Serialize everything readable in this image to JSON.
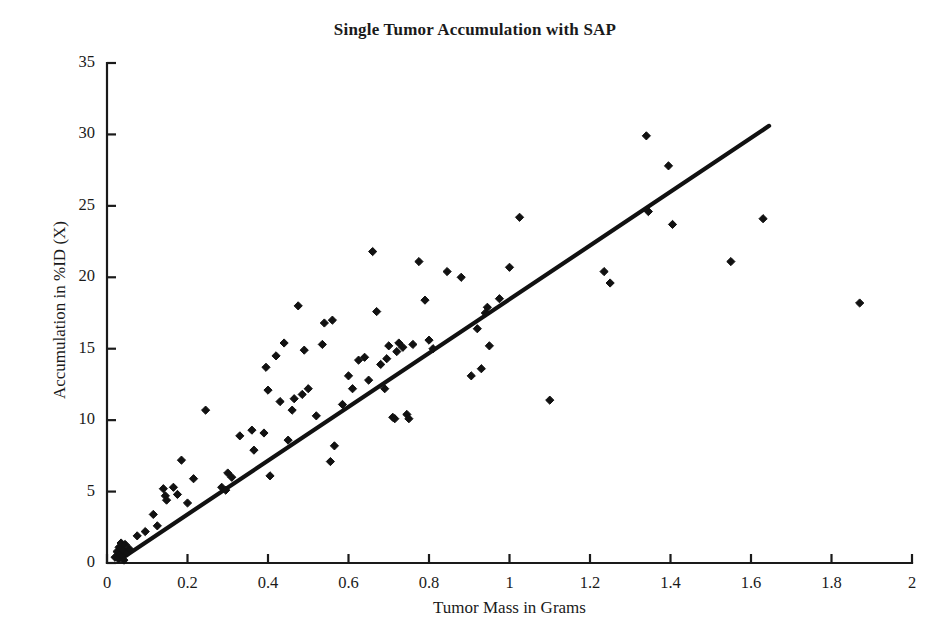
{
  "chart_data": {
    "type": "scatter",
    "title": "Single Tumor Accumulation with SAP",
    "xlabel": "Tumor Mass in Grams",
    "ylabel": "Accumulation in %ID (X)",
    "xlim": [
      0,
      2
    ],
    "ylim": [
      0,
      35
    ],
    "xticks": [
      0,
      0.2,
      0.4,
      0.6,
      0.8,
      1,
      1.2,
      1.4,
      1.6,
      1.8,
      2
    ],
    "xtick_labels": [
      "0",
      "0.2",
      "0.4",
      "0.6",
      "0.8",
      "1",
      "1.2",
      "1.4",
      "1.6",
      "1.8",
      "2"
    ],
    "yticks": [
      0,
      5,
      10,
      15,
      20,
      25,
      30,
      35
    ],
    "ytick_labels": [
      "0",
      "5",
      "10",
      "15",
      "20",
      "25",
      "30",
      "35"
    ],
    "grid": false,
    "legend": "none",
    "marker": "diamond",
    "marker_color": "#111111",
    "line_color": "#111111",
    "axis_color": "#1a1a1a",
    "trendline": {
      "label": "linear fit",
      "x": [
        0.03,
        1.645
      ],
      "y": [
        0.2,
        30.6
      ],
      "slope": 18.8,
      "intercept": -0.36
    },
    "points": [
      [
        0.02,
        0.4
      ],
      [
        0.025,
        0.8
      ],
      [
        0.028,
        0.3
      ],
      [
        0.03,
        1.1
      ],
      [
        0.032,
        0.6
      ],
      [
        0.035,
        1.4
      ],
      [
        0.038,
        0.5
      ],
      [
        0.04,
        0.9
      ],
      [
        0.042,
        0.2
      ],
      [
        0.045,
        1.3
      ],
      [
        0.05,
        0.7
      ],
      [
        0.055,
        1.0
      ],
      [
        0.075,
        1.9
      ],
      [
        0.095,
        2.2
      ],
      [
        0.115,
        3.4
      ],
      [
        0.125,
        2.6
      ],
      [
        0.14,
        5.2
      ],
      [
        0.145,
        4.7
      ],
      [
        0.148,
        4.4
      ],
      [
        0.165,
        5.3
      ],
      [
        0.175,
        4.8
      ],
      [
        0.185,
        7.2
      ],
      [
        0.2,
        4.2
      ],
      [
        0.215,
        5.9
      ],
      [
        0.245,
        10.7
      ],
      [
        0.285,
        5.3
      ],
      [
        0.295,
        5.1
      ],
      [
        0.3,
        6.3
      ],
      [
        0.31,
        6.0
      ],
      [
        0.33,
        8.9
      ],
      [
        0.36,
        9.3
      ],
      [
        0.365,
        7.9
      ],
      [
        0.39,
        9.1
      ],
      [
        0.395,
        13.7
      ],
      [
        0.4,
        12.1
      ],
      [
        0.405,
        6.1
      ],
      [
        0.42,
        14.5
      ],
      [
        0.43,
        11.3
      ],
      [
        0.44,
        15.4
      ],
      [
        0.45,
        8.6
      ],
      [
        0.46,
        10.7
      ],
      [
        0.465,
        11.5
      ],
      [
        0.475,
        18.0
      ],
      [
        0.485,
        11.8
      ],
      [
        0.49,
        14.9
      ],
      [
        0.5,
        12.2
      ],
      [
        0.52,
        10.3
      ],
      [
        0.535,
        15.3
      ],
      [
        0.54,
        16.8
      ],
      [
        0.555,
        7.1
      ],
      [
        0.56,
        17.0
      ],
      [
        0.565,
        8.2
      ],
      [
        0.585,
        11.1
      ],
      [
        0.6,
        13.1
      ],
      [
        0.61,
        12.2
      ],
      [
        0.625,
        14.2
      ],
      [
        0.64,
        14.4
      ],
      [
        0.65,
        12.8
      ],
      [
        0.66,
        21.8
      ],
      [
        0.67,
        17.6
      ],
      [
        0.68,
        13.9
      ],
      [
        0.69,
        12.2
      ],
      [
        0.695,
        14.3
      ],
      [
        0.7,
        15.2
      ],
      [
        0.71,
        10.2
      ],
      [
        0.715,
        10.1
      ],
      [
        0.72,
        14.8
      ],
      [
        0.725,
        15.4
      ],
      [
        0.735,
        15.1
      ],
      [
        0.745,
        10.4
      ],
      [
        0.75,
        10.1
      ],
      [
        0.76,
        15.3
      ],
      [
        0.775,
        21.1
      ],
      [
        0.79,
        18.4
      ],
      [
        0.8,
        15.6
      ],
      [
        0.81,
        15.0
      ],
      [
        0.845,
        20.4
      ],
      [
        0.88,
        20.0
      ],
      [
        0.905,
        13.1
      ],
      [
        0.92,
        16.4
      ],
      [
        0.93,
        13.6
      ],
      [
        0.94,
        17.5
      ],
      [
        0.945,
        17.9
      ],
      [
        0.95,
        15.2
      ],
      [
        0.975,
        18.5
      ],
      [
        1.0,
        20.7
      ],
      [
        1.025,
        24.2
      ],
      [
        1.1,
        11.4
      ],
      [
        1.235,
        20.4
      ],
      [
        1.25,
        19.6
      ],
      [
        1.34,
        29.9
      ],
      [
        1.345,
        24.6
      ],
      [
        1.395,
        27.8
      ],
      [
        1.405,
        23.7
      ],
      [
        1.55,
        21.1
      ],
      [
        1.63,
        24.1
      ],
      [
        1.87,
        18.2
      ]
    ],
    "n_points": 97
  }
}
